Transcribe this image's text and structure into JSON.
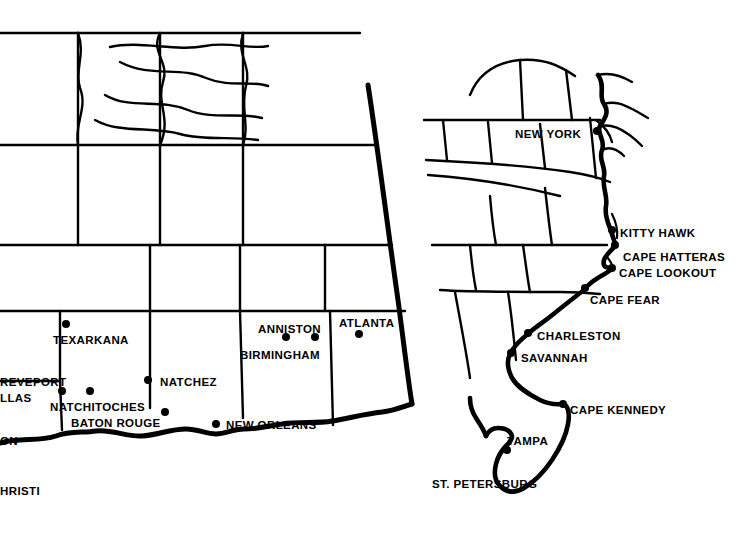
{
  "map": {
    "title": "Southeastern and Eastern United States coastal map",
    "background_color": "#ffffff",
    "line_color": "#000000",
    "dot_color": "#000000",
    "labels": [
      {
        "text": "NEW YORK",
        "x": 515,
        "y": 129,
        "anchor": "start"
      },
      {
        "text": "KITTY HAWK",
        "x": 620,
        "y": 228,
        "anchor": "start"
      },
      {
        "text": "CAPE HATTERAS",
        "x": 623,
        "y": 252,
        "anchor": "start"
      },
      {
        "text": "CAPE LOOKOUT",
        "x": 619,
        "y": 268,
        "anchor": "start"
      },
      {
        "text": "CAPE FEAR",
        "x": 590,
        "y": 295,
        "anchor": "start"
      },
      {
        "text": "CHARLESTON",
        "x": 537,
        "y": 331,
        "anchor": "start"
      },
      {
        "text": "SAVANNAH",
        "x": 521,
        "y": 353,
        "anchor": "start"
      },
      {
        "text": "CAPE KENNEDY",
        "x": 570,
        "y": 405,
        "anchor": "start"
      },
      {
        "text": "TAMPA",
        "x": 507,
        "y": 436,
        "anchor": "start"
      },
      {
        "text": "ST. PETERSBURG",
        "x": 432,
        "y": 479,
        "anchor": "start"
      },
      {
        "text": "ATLANTA",
        "x": 339,
        "y": 318,
        "anchor": "start"
      },
      {
        "text": "ANNISTON",
        "x": 258,
        "y": 324,
        "anchor": "start"
      },
      {
        "text": "BIRMINGHAM",
        "x": 240,
        "y": 350,
        "anchor": "start"
      },
      {
        "text": "NATCHEZ",
        "x": 160,
        "y": 377,
        "anchor": "start"
      },
      {
        "text": "TEXARKANA",
        "x": 53,
        "y": 335,
        "anchor": "start"
      },
      {
        "text": "REVEPORT",
        "x": 0,
        "y": 377,
        "anchor": "start"
      },
      {
        "text": "LLAS",
        "x": 0,
        "y": 393,
        "anchor": "start"
      },
      {
        "text": "NATCHITOCHES",
        "x": 50,
        "y": 402,
        "anchor": "start"
      },
      {
        "text": "BATON ROUGE",
        "x": 71,
        "y": 418,
        "anchor": "start"
      },
      {
        "text": "NEW ORLEANS",
        "x": 226,
        "y": 420,
        "anchor": "start"
      },
      {
        "text": "ON",
        "x": 0,
        "y": 436,
        "anchor": "start"
      },
      {
        "text": "HRISTI",
        "x": 0,
        "y": 486,
        "anchor": "start"
      }
    ],
    "city_dots": [
      {
        "name": "new-york",
        "x": 597,
        "y": 131,
        "r": 4
      },
      {
        "name": "kitty-hawk",
        "x": 612,
        "y": 230,
        "r": 4
      },
      {
        "name": "cape-hatteras",
        "x": 615,
        "y": 245,
        "r": 4
      },
      {
        "name": "cape-lookout",
        "x": 612,
        "y": 268,
        "r": 4
      },
      {
        "name": "cape-fear",
        "x": 585,
        "y": 288,
        "r": 4
      },
      {
        "name": "charleston",
        "x": 528,
        "y": 333,
        "r": 4
      },
      {
        "name": "savannah",
        "x": 511,
        "y": 353,
        "r": 4
      },
      {
        "name": "cape-kennedy",
        "x": 563,
        "y": 404,
        "r": 4
      },
      {
        "name": "tampa",
        "x": 507,
        "y": 450,
        "r": 4
      },
      {
        "name": "atlanta",
        "x": 359,
        "y": 334,
        "r": 4
      },
      {
        "name": "anniston",
        "x": 286,
        "y": 337,
        "r": 4
      },
      {
        "name": "birmingham",
        "x": 315,
        "y": 337,
        "r": 4
      },
      {
        "name": "natchez",
        "x": 148,
        "y": 380,
        "r": 4
      },
      {
        "name": "texarkana",
        "x": 66,
        "y": 324,
        "r": 4
      },
      {
        "name": "shreveport",
        "x": 62,
        "y": 391,
        "r": 4
      },
      {
        "name": "natchitoches",
        "x": 90,
        "y": 391,
        "r": 4
      },
      {
        "name": "baton-rouge",
        "x": 165,
        "y": 412,
        "r": 4
      },
      {
        "name": "new-orleans",
        "x": 216,
        "y": 424,
        "r": 4
      }
    ]
  }
}
